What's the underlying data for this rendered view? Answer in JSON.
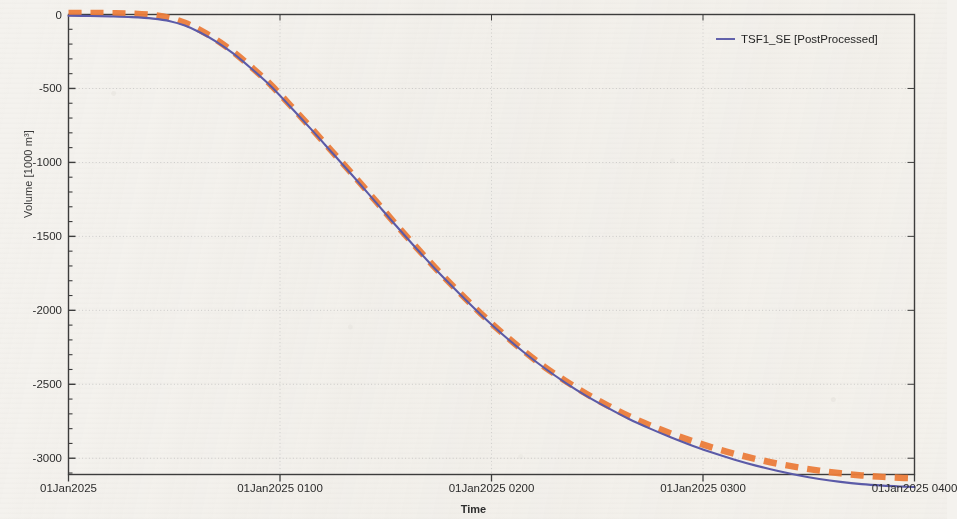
{
  "chart_data": {
    "type": "line",
    "title": "",
    "xlabel": "Time",
    "ylabel": "Volume [1000 m³]",
    "xlim": [
      "01Jan2025 0000",
      "01Jan2025 0400"
    ],
    "ylim": [
      -3250,
      50
    ],
    "grid": true,
    "legend_position": "top-right",
    "x_tick_labels": [
      "01Jan2025",
      "01Jan2025 0100",
      "01Jan2025 0200",
      "01Jan2025 0300",
      "01Jan2025 0400"
    ],
    "x_tick_hours": [
      0,
      1,
      2,
      3,
      4
    ],
    "y_tick_labels": [
      "0",
      "-500",
      "-1000",
      "-1500",
      "-2000",
      "-2500",
      "-3000"
    ],
    "y_tick_values": [
      0,
      -500,
      -1000,
      -1500,
      -2000,
      -2500,
      -3000
    ],
    "y_minor_interval": 100,
    "x_minor_divisions": 4,
    "series": [
      {
        "name": "TSF1_SE [PostProcessed]",
        "style": "solid",
        "color": "#5b5baa",
        "in_legend": true,
        "x_hours": [
          0.0,
          0.1,
          0.2,
          0.3,
          0.4,
          0.48,
          0.55,
          0.62,
          0.7,
          0.78,
          0.86,
          0.95,
          1.05,
          1.15,
          1.25,
          1.35,
          1.45,
          1.55,
          1.65,
          1.75,
          1.85,
          1.95,
          2.05,
          2.15,
          2.25,
          2.35,
          2.45,
          2.55,
          2.65,
          2.75,
          2.85,
          2.95,
          3.05,
          3.15,
          3.25,
          3.35,
          3.45,
          3.55,
          3.65,
          3.75,
          3.85,
          3.95,
          4.0
        ],
        "values": [
          -8,
          -10,
          -13,
          -18,
          -28,
          -45,
          -75,
          -120,
          -185,
          -265,
          -360,
          -475,
          -625,
          -780,
          -940,
          -1100,
          -1265,
          -1430,
          -1590,
          -1745,
          -1890,
          -2030,
          -2160,
          -2280,
          -2390,
          -2490,
          -2580,
          -2660,
          -2735,
          -2800,
          -2860,
          -2915,
          -2965,
          -3010,
          -3050,
          -3085,
          -3115,
          -3140,
          -3160,
          -3175,
          -3185,
          -3192,
          -3195
        ]
      },
      {
        "name": "TSF1_SE [Observed]",
        "style": "dashed",
        "color": "#ed7d3a",
        "in_legend": false,
        "x_hours": [
          0.0,
          0.1,
          0.2,
          0.3,
          0.4,
          0.48,
          0.55,
          0.62,
          0.7,
          0.78,
          0.86,
          0.95,
          1.05,
          1.15,
          1.25,
          1.35,
          1.45,
          1.55,
          1.65,
          1.75,
          1.85,
          1.95,
          2.05,
          2.15,
          2.25,
          2.35,
          2.45,
          2.55,
          2.65,
          2.75,
          2.85,
          2.95,
          3.05,
          3.15,
          3.25,
          3.35,
          3.45,
          3.55,
          3.65,
          3.75,
          3.85,
          3.95,
          4.0
        ],
        "values": [
          10,
          10,
          9,
          6,
          -4,
          -24,
          -56,
          -104,
          -172,
          -254,
          -350,
          -466,
          -616,
          -772,
          -932,
          -1092,
          -1257,
          -1422,
          -1582,
          -1737,
          -1882,
          -2022,
          -2152,
          -2272,
          -2382,
          -2478,
          -2566,
          -2644,
          -2716,
          -2778,
          -2834,
          -2884,
          -2930,
          -2970,
          -3005,
          -3036,
          -3062,
          -3084,
          -3102,
          -3116,
          -3126,
          -3133,
          -3136
        ]
      }
    ]
  },
  "legend": {
    "entry_label": "TSF1_SE [PostProcessed]",
    "swatch_color": "#6262ae"
  },
  "axes": {
    "y_title": "Volume [1000 m³]",
    "x_title": "Time"
  }
}
